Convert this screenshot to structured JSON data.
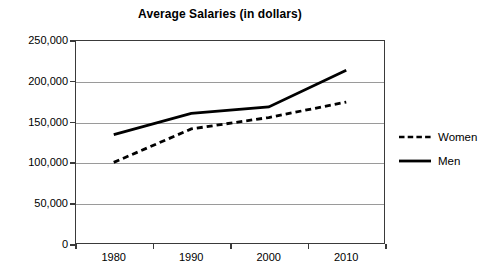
{
  "chart_data": {
    "type": "line",
    "title": "Average Salaries (in dollars)",
    "xlabel": "",
    "ylabel": "",
    "categories": [
      "1980",
      "1990",
      "2000",
      "2010"
    ],
    "x": [
      1980,
      1990,
      2000,
      2010
    ],
    "series": [
      {
        "name": "Women",
        "style": "dashed",
        "color": "#000000",
        "values": [
          100000,
          141000,
          155000,
          174000
        ]
      },
      {
        "name": "Men",
        "style": "solid",
        "color": "#000000",
        "values": [
          134000,
          160000,
          168000,
          213000
        ]
      }
    ],
    "ylim": [
      0,
      250000
    ],
    "yticks": [
      0,
      50000,
      100000,
      150000,
      200000,
      250000
    ],
    "ytick_labels": [
      "0",
      "50,000",
      "100,000",
      "150,000",
      "200,000",
      "250,000"
    ],
    "xtick_labels": [
      "1980",
      "1990",
      "2000",
      "2010"
    ],
    "grid": "horizontal",
    "legend_position": "right"
  },
  "legend": {
    "items": [
      {
        "label": "Women",
        "swatch": "dashed-line-icon"
      },
      {
        "label": "Men",
        "swatch": "solid-line-icon"
      }
    ]
  }
}
